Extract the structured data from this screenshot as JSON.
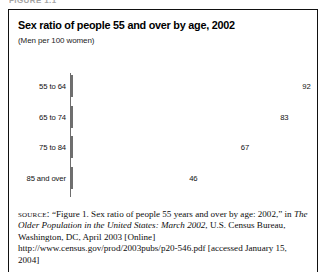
{
  "figure": {
    "caption_strip": "FIGURE 1.1",
    "title": "Sex ratio of people 55 and over by age, 2002",
    "subtitle": "(Men per 100 women)"
  },
  "source": {
    "label": "source:",
    "part1": " “Figure 1. Sex ratio of people 55 years and over by age: 2002,” in ",
    "italic": "The Older Population in the United States: March 2002",
    "part2": ", U.S. Census Bureau, Washington, DC, April 2003 [Online] http://www.census.gov/prod/2003pubs/p20-546.pdf [accessed January 15, 2004]"
  },
  "colors": {
    "bar_fill": "#808080",
    "bar_stroke": "#6f6f6f",
    "axis": "#6d6d6d",
    "frame": "#111111",
    "text": "#000000"
  },
  "chart_data": {
    "type": "bar",
    "orientation": "horizontal",
    "title": "Sex ratio of people 55 and over by age, 2002",
    "subtitle": "(Men per 100 women)",
    "xlabel": "",
    "ylabel": "",
    "xlim": [
      0,
      100
    ],
    "grid": false,
    "legend": false,
    "value_labels": true,
    "categories": [
      "55 to 64",
      "65 to 74",
      "75 to 84",
      "85 and over"
    ],
    "values": [
      92,
      83,
      67,
      46
    ],
    "points": [
      {
        "category": "55 to 64",
        "value": 92,
        "label": "92"
      },
      {
        "category": "65 to 74",
        "value": 83,
        "label": "83"
      },
      {
        "category": "75 to 84",
        "value": 67,
        "label": "67"
      },
      {
        "category": "85 and over",
        "value": 46,
        "label": "46"
      }
    ]
  }
}
